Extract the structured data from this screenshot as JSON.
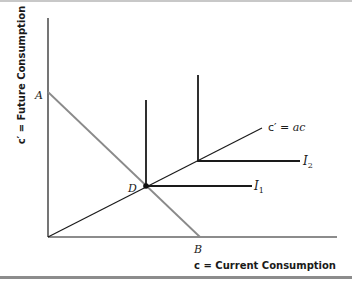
{
  "diagram": {
    "type": "consumption-choice-perfect-complements",
    "x_axis_label": "c = Current Consumption",
    "y_axis_label": "c′ = Future Consumption",
    "points": {
      "A": "A",
      "B": "B",
      "D": "D"
    },
    "lines": {
      "ray_label_prefix": "c′ = ",
      "ray_label_var": "ac",
      "indiff1_label": "I",
      "indiff1_sub": "1",
      "indiff2_label": "I",
      "indiff2_sub": "2"
    },
    "colors": {
      "axis": "#1a1a1a",
      "budget_line": "#8a8a8a",
      "indifference": "#1a1a1a",
      "ray": "#1a1a1a",
      "bottom_rule": "#8c8c8c"
    }
  }
}
